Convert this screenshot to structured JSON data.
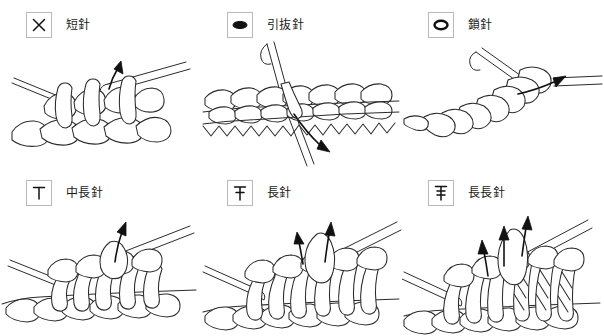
{
  "page": {
    "background_color": "#ffffff",
    "ink_color": "#2b2b2b",
    "box_border_color": "#b9b9b9",
    "columns": 3,
    "rows": 2
  },
  "stitches": [
    {
      "id": "single-crochet",
      "symbol_name": "x-cross-symbol",
      "symbol_glyph": "×",
      "label": "短針",
      "illustration_name": "single-crochet-illustration",
      "arrows": 1
    },
    {
      "id": "slip-stitch",
      "symbol_name": "filled-oval-symbol",
      "symbol_glyph": "●",
      "label": "引抜針",
      "illustration_name": "slip-stitch-illustration",
      "arrows": 1
    },
    {
      "id": "chain-stitch",
      "symbol_name": "open-oval-symbol",
      "symbol_glyph": "○",
      "label": "鎖針",
      "illustration_name": "chain-stitch-illustration",
      "arrows": 1
    },
    {
      "id": "half-double-crochet",
      "symbol_name": "t-bar-symbol",
      "symbol_glyph": "T",
      "label": "中長針",
      "illustration_name": "half-double-crochet-illustration",
      "arrows": 1
    },
    {
      "id": "double-crochet",
      "symbol_name": "t-bar-one-stroke-symbol",
      "symbol_glyph": "T",
      "label": "長針",
      "illustration_name": "double-crochet-illustration",
      "arrows": 2
    },
    {
      "id": "treble-crochet",
      "symbol_name": "t-bar-two-stroke-symbol",
      "symbol_glyph": "T",
      "label": "長長針",
      "illustration_name": "treble-crochet-illustration",
      "arrows": 3
    }
  ]
}
